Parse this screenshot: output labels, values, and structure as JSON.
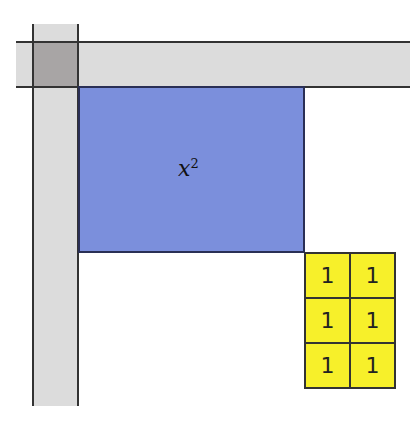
{
  "diagram": {
    "type": "completing-the-square algebra tiles",
    "colors": {
      "strip": "#dcdcdc",
      "corner": "#a8a5a5",
      "square": "#7b8fdc",
      "unit_tile": "#f7f02a",
      "outline": "#333333"
    },
    "square": {
      "label_base": "x",
      "label_exp": "2"
    },
    "unit_tiles": {
      "rows": 3,
      "cols": 2,
      "values": [
        "1",
        "1",
        "1",
        "1",
        "1",
        "1"
      ]
    }
  }
}
